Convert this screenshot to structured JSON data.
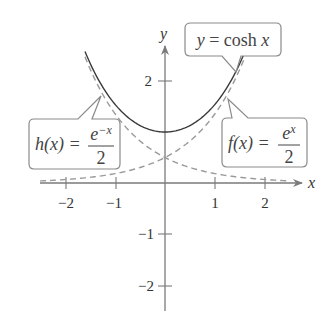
{
  "chart_data": {
    "type": "line",
    "title": "",
    "xlabel": "x",
    "ylabel": "y",
    "xlim": [
      -2.5,
      2.7
    ],
    "ylim": [
      -2.5,
      2.7
    ],
    "x_ticks": [
      "−2",
      "−1",
      "1",
      "2"
    ],
    "y_ticks": [
      "2",
      "−1",
      "−2"
    ],
    "grid": false,
    "series": [
      {
        "name": "y = cosh x",
        "style": "solid",
        "formula": "cosh(x)",
        "x_range": [
          -1.6,
          1.6
        ],
        "points": [
          [
            -1.6,
            2.58
          ],
          [
            -1,
            1.54
          ],
          [
            0,
            1
          ],
          [
            1,
            1.54
          ],
          [
            1.6,
            2.58
          ]
        ]
      },
      {
        "name": "f(x) = e^x / 2",
        "style": "dashed",
        "formula": "exp(x)/2",
        "x_range": [
          -2.5,
          1.6
        ],
        "points": [
          [
            -2,
            0.07
          ],
          [
            -1,
            0.18
          ],
          [
            0,
            0.5
          ],
          [
            1,
            1.36
          ],
          [
            1.6,
            2.48
          ]
        ]
      },
      {
        "name": "h(x) = e^-x / 2",
        "style": "dashed",
        "formula": "exp(-x)/2",
        "x_range": [
          -1.6,
          2.5
        ],
        "points": [
          [
            -1.6,
            2.48
          ],
          [
            -1,
            1.36
          ],
          [
            0,
            0.5
          ],
          [
            1,
            0.18
          ],
          [
            2,
            0.07
          ]
        ]
      }
    ],
    "annotations": [
      {
        "label": "y = cosh x",
        "target": "cosh"
      },
      {
        "label": "f(x) = e^x / 2",
        "target": "f"
      },
      {
        "label": "h(x) = e^-x / 2",
        "target": "h"
      }
    ]
  },
  "labels": {
    "x_axis": "x",
    "y_axis": "y",
    "xt_m2": "−2",
    "xt_m1": "−1",
    "xt_1": "1",
    "xt_2": "2",
    "yt_2": "2",
    "yt_m1": "−1",
    "yt_m2": "−2"
  },
  "callouts": {
    "cosh": {
      "lhs": "y",
      "eq": " = cosh ",
      "var": "x"
    },
    "f": {
      "lhs": "f(x) = ",
      "num_base": "e",
      "num_exp": "x",
      "den": "2"
    },
    "h": {
      "lhs": "h(x) = ",
      "num_base": "e",
      "num_exp": "−x",
      "den": "2"
    }
  }
}
